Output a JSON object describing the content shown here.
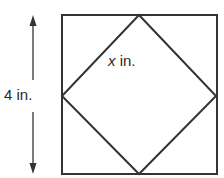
{
  "figure": {
    "type": "geometry-diagram",
    "colors": {
      "stroke": "#333333",
      "text": "#2a2a2a",
      "background": "#ffffff"
    },
    "outer_square": {
      "side_length_label": "4 in.",
      "side_value": 4,
      "unit": "in."
    },
    "inner_square": {
      "side_label_variable": "x",
      "side_label_unit": " in.",
      "side_label_full": "x in."
    },
    "dimension_arrow": {
      "orientation": "vertical",
      "label": "4 in."
    }
  }
}
